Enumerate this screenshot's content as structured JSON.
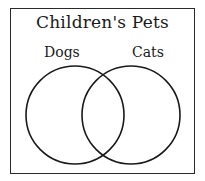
{
  "diagram": {
    "type": "venn",
    "title": "Children's Pets",
    "sets": [
      {
        "label": "Dogs",
        "cx": 75,
        "cy": 115,
        "r": 49
      },
      {
        "label": "Cats",
        "cx": 131,
        "cy": 115,
        "r": 49
      }
    ],
    "stroke_color": "#1a1a1a"
  }
}
